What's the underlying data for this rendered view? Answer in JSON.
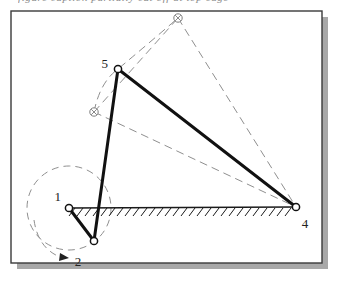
{
  "figure": {
    "kind": "mechanism-linkage-diagram",
    "caption_clipped": "figure caption partially cut off at top edge",
    "frame": {
      "x": 11,
      "y": 11,
      "width": 311,
      "height": 252,
      "border_color": "#3a3a3a",
      "fill_color": "#ffffff",
      "shadow_color": "#a8a8a8",
      "shadow_offset": 6
    },
    "style": {
      "solid_link_color": "#111111",
      "solid_link_width": 3,
      "ghost_color": "#8f8f8f",
      "ghost_width": 1,
      "ground_color": "#1a1a1a",
      "joint_fill": "#ffffff",
      "label_color": "#222222"
    },
    "joints": [
      {
        "id": "j1",
        "label": "1",
        "x": 69,
        "y": 208,
        "r": 3.6,
        "type": "ground-pivot",
        "label_x": 61,
        "label_y": 196,
        "label_anchor": "end"
      },
      {
        "id": "j2",
        "label": "2",
        "x": 94,
        "y": 241,
        "r": 3.6,
        "type": "crank-pin",
        "label_x": 76,
        "label_y": 262,
        "label_anchor": "middle"
      },
      {
        "id": "j4",
        "label": "4",
        "x": 296,
        "y": 207,
        "r": 3.6,
        "type": "ground-pivot",
        "label_x": 304,
        "label_y": 226,
        "label_anchor": "middle"
      },
      {
        "id": "j5",
        "label": "5",
        "x": 118,
        "y": 69,
        "r": 3.6,
        "type": "coupler-pivot",
        "label_x": 107,
        "label_y": 64,
        "label_anchor": "end"
      }
    ],
    "ghost_joints": [
      {
        "id": "g-top",
        "x": 178,
        "y": 18,
        "r": 4.2,
        "marker": "cross-circle"
      },
      {
        "id": "g-left",
        "x": 94,
        "y": 112,
        "r": 4.2,
        "marker": "cross-circle"
      }
    ],
    "solid_links": [
      {
        "name": "crank-1-2",
        "from": "j1",
        "to": "j2"
      },
      {
        "name": "coupler-2-5",
        "from": "j2",
        "to": "j5"
      },
      {
        "name": "rocker-5-4",
        "from": "j5",
        "to": "j4"
      }
    ],
    "ghost_links": [
      {
        "name": "ghost-coupler-left",
        "x1": 94,
        "y1": 112,
        "x2": 178,
        "y2": 18
      },
      {
        "name": "ghost-rocker-top",
        "x1": 178,
        "y1": 18,
        "x2": 296,
        "y2": 207
      },
      {
        "name": "ghost-rocker-mid",
        "x1": 94,
        "y1": 112,
        "x2": 296,
        "y2": 207
      }
    ],
    "ghost_arcs": [
      {
        "name": "coupler-path-arc",
        "d": "M 94 112 Q 98 80 118 69 Q 150 42 178 18"
      },
      {
        "name": "crank-circle",
        "cx": 69,
        "cy": 208,
        "r": 42,
        "dash": "7 5"
      }
    ],
    "ground_line": {
      "x1": 69,
      "y1": 208,
      "x2": 296,
      "y2": 207,
      "hatch_count": 27,
      "hatch_len": 8,
      "hatch_angle_deg": 52
    },
    "rotation_arrow": {
      "name": "crank-rotation-arrow",
      "path": "M 36 222 Q 40 248 62 257",
      "arrow_x": 66,
      "arrow_y": 258,
      "direction": "clockwise"
    }
  }
}
